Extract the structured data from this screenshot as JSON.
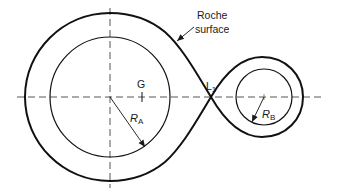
{
  "diagram": {
    "type": "roche-lobe",
    "labels": {
      "roche_line1": "Roche",
      "roche_line2": "surface",
      "center_of_mass": "G",
      "lagrange_point": "L",
      "lagrange_sub": "1",
      "radius_a": "R",
      "radius_a_sub": "A",
      "radius_b": "R",
      "radius_b_sub": "B"
    },
    "colors": {
      "stroke": "#1a1a1a",
      "background": "#ffffff"
    }
  }
}
